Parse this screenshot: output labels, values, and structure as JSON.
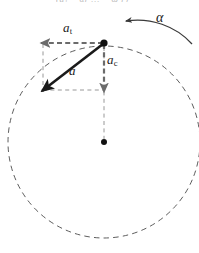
{
  "figure": {
    "width": 199,
    "height": 253,
    "background_color": "#ffffff"
  },
  "colors": {
    "vector_gray": "#6b6b6b",
    "resultant_black": "#1a1a1a",
    "dashed_construction": "#8c8c8c",
    "circle_dash": "#4a4a4a",
    "label_text": "#1a1a1a",
    "cropped_text": "#b9b9b9"
  },
  "labels": {
    "tangential": {
      "symbol": "a",
      "subscript": "t",
      "name": "tangential-acceleration"
    },
    "centripetal": {
      "symbol": "a",
      "subscript": "c",
      "name": "centripetal-acceleration"
    },
    "resultant": {
      "symbol": "a",
      "subscript": "",
      "name": "total-acceleration"
    },
    "angular": {
      "symbol": "α",
      "subscript": "",
      "name": "angular-acceleration"
    },
    "cropped_formula_fragment": "(a₁ = αr … = ω²r)"
  },
  "geometry": {
    "circle": {
      "center_x": 104,
      "center_y": 142,
      "radius": 96,
      "style": "dashed"
    },
    "particle": {
      "x": 104,
      "y": 43,
      "radius": 3.6
    },
    "center_dot": {
      "x": 104,
      "y": 142,
      "radius": 3.0
    },
    "tangential_vector": {
      "from_x": 104,
      "from_y": 43,
      "to_x": 43,
      "to_y": 43,
      "direction": "left"
    },
    "centripetal_vector": {
      "from_x": 104,
      "from_y": 43,
      "to_x": 104,
      "to_y": 90,
      "direction": "down"
    },
    "resultant_vector": {
      "from_x": 104,
      "from_y": 43,
      "to_x": 44,
      "to_y": 89,
      "direction": "down-left"
    },
    "radius_line": {
      "from_x": 104,
      "from_y": 90,
      "to_x": 104,
      "to_y": 142,
      "style": "dashed"
    },
    "construction_left": {
      "x": 43,
      "from_y": 43,
      "to_y": 90,
      "style": "dashed"
    },
    "construction_bottom": {
      "y": 90,
      "from_x": 43,
      "to_x": 104,
      "style": "dashed"
    },
    "alpha_arc": {
      "start_x": 191,
      "start_y": 43,
      "end_x": 124,
      "end_y": 21,
      "arrowhead": "start-end-left",
      "sense": "counterclockwise"
    }
  }
}
